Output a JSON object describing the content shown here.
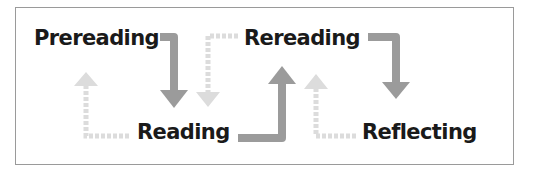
{
  "diagram": {
    "type": "process-cycle",
    "stages": [
      {
        "id": "prereading",
        "label": "Prereading"
      },
      {
        "id": "reading",
        "label": "Reading"
      },
      {
        "id": "rereading",
        "label": "Rereading"
      },
      {
        "id": "reflecting",
        "label": "Reflecting"
      }
    ],
    "connections": [
      {
        "from": "Prereading",
        "to": "Reading",
        "style": "solid"
      },
      {
        "from": "Reading",
        "to": "Rereading",
        "style": "solid"
      },
      {
        "from": "Rereading",
        "to": "Reflecting",
        "style": "solid"
      },
      {
        "from": "Reading",
        "to": "Prereading",
        "style": "dashed"
      },
      {
        "from": "Rereading",
        "to": "Reading",
        "style": "dashed"
      },
      {
        "from": "Reflecting",
        "to": "Rereading",
        "style": "dashed"
      }
    ],
    "colors": {
      "solid_arrow": "#9b9b9b",
      "dashed_arrow": "#dcdcdc",
      "text": "#1a1a1a",
      "border": "#9a9a9a"
    }
  }
}
